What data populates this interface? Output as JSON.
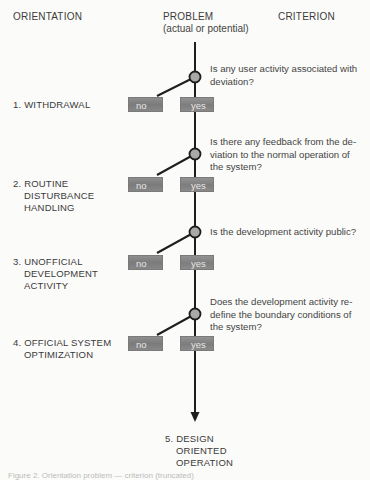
{
  "headers": {
    "orientation": "ORIENTATION",
    "problem": "PROBLEM",
    "problem_sub": "(actual or potential)",
    "criterion": "CRITERION"
  },
  "steps": [
    {
      "question": "Is any user activity associated with deviation?",
      "orientation_lines": [
        "1. WITHDRAWAL"
      ],
      "no_label": "no",
      "yes_label": "yes"
    },
    {
      "question": "Is there any feedback from the de-viation to the normal operation of the system?",
      "question_lines": [
        "Is there any feedback from the de-",
        "viation to the normal operation of",
        "the system?"
      ],
      "orientation_lines": [
        "2. ROUTINE",
        "DISTURBANCE",
        "HANDLING"
      ],
      "no_label": "no",
      "yes_label": "yes"
    },
    {
      "question": "Is the development activity public?",
      "orientation_lines": [
        "3. UNOFFICIAL",
        "DEVELOPMENT",
        "ACTIVITY"
      ],
      "no_label": "no",
      "yes_label": "yes"
    },
    {
      "question": "Does the development activity re-define the boundary conditions of the system?",
      "question_lines": [
        "Does the development activity re-",
        "define the boundary conditions of",
        "the system?"
      ],
      "orientation_lines": [
        "4. OFFICIAL SYSTEM",
        "OPTIMIZATION"
      ],
      "no_label": "no",
      "yes_label": "yes"
    }
  ],
  "final": {
    "orientation_lines": [
      "5. DESIGN",
      "ORIENTED",
      "OPERATION"
    ]
  },
  "caption": "Figure 2.  Orientation problem — criterion (truncated)",
  "colors": {
    "background": "#fbfbf9",
    "line": "#1e1e1e",
    "box_fill": "#858585",
    "node_fill": "#a9a9a9",
    "text": "#3a3a3a"
  }
}
